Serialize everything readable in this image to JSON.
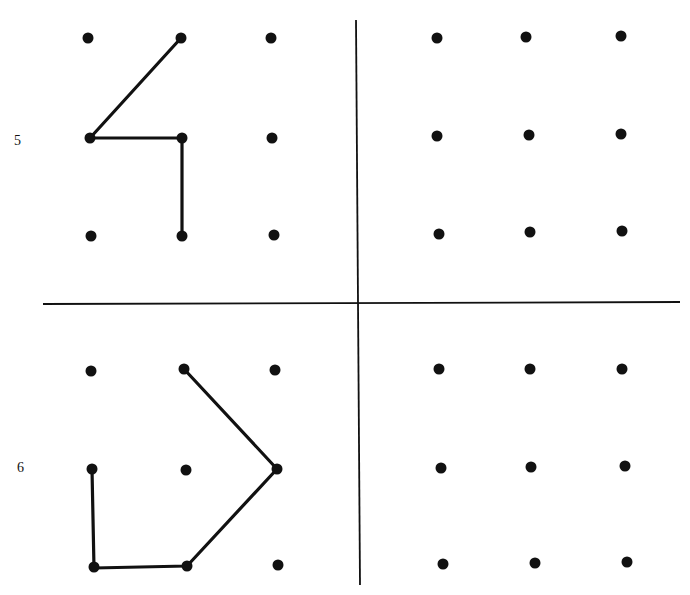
{
  "header": {
    "cut_text": ""
  },
  "problems": [
    {
      "label": "5",
      "label_pos": [
        14,
        133
      ],
      "example_grid": {
        "dots": [
          [
            88,
            38
          ],
          [
            181,
            38
          ],
          [
            271,
            38
          ],
          [
            90,
            138
          ],
          [
            182,
            138
          ],
          [
            272,
            138
          ],
          [
            91,
            236
          ],
          [
            182,
            236
          ],
          [
            274,
            235
          ]
        ],
        "path": [
          [
            181,
            38
          ],
          [
            90,
            138
          ],
          [
            182,
            138
          ],
          [
            182,
            236
          ]
        ]
      },
      "answer_grid": {
        "dots": [
          [
            437,
            38
          ],
          [
            526,
            37
          ],
          [
            621,
            36
          ],
          [
            437,
            136
          ],
          [
            529,
            135
          ],
          [
            621,
            134
          ],
          [
            439,
            234
          ],
          [
            530,
            232
          ],
          [
            622,
            231
          ]
        ],
        "path": []
      }
    },
    {
      "label": "6",
      "label_pos": [
        17,
        460
      ],
      "example_grid": {
        "dots": [
          [
            91,
            371
          ],
          [
            184,
            369
          ],
          [
            275,
            370
          ],
          [
            92,
            469
          ],
          [
            186,
            470
          ],
          [
            277,
            469
          ],
          [
            94,
            567
          ],
          [
            187,
            566
          ],
          [
            278,
            565
          ]
        ],
        "path": [
          [
            184,
            369
          ],
          [
            277,
            469
          ],
          [
            187,
            566
          ],
          [
            94,
            568
          ],
          [
            92,
            469
          ]
        ]
      },
      "answer_grid": {
        "dots": [
          [
            439,
            369
          ],
          [
            530,
            369
          ],
          [
            622,
            369
          ],
          [
            441,
            468
          ],
          [
            531,
            467
          ],
          [
            625,
            466
          ],
          [
            443,
            564
          ],
          [
            535,
            563
          ],
          [
            627,
            562
          ]
        ],
        "path": []
      }
    }
  ],
  "dividers": {
    "vertical": {
      "x1": 356,
      "y1": 20,
      "x2": 360,
      "y2": 585
    },
    "horizontal": {
      "x1": 43,
      "y1": 304,
      "x2": 680,
      "y2": 302
    }
  },
  "style": {
    "ink": "#111111",
    "dot_radius": 5.5,
    "stroke_width": 3.2,
    "divider_width": 1.8
  }
}
